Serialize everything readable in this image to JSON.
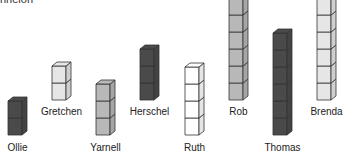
{
  "top_fragment": "nnelon",
  "colors": {
    "dark": "#4a4a4a",
    "medium": "#b8b8b8",
    "light": "#e6e6e6",
    "white": "#ffffff",
    "outline": "#333333"
  },
  "stacks": [
    {
      "name": "Ollie",
      "cubes": 2,
      "shade": "dark",
      "x": 8,
      "bottom": 135,
      "label_y": 142
    },
    {
      "name": "Gretchen",
      "cubes": 2,
      "shade": "light",
      "x": 52,
      "bottom": 100,
      "label_y": 106
    },
    {
      "name": "Yarnell",
      "cubes": 3,
      "shade": "medium",
      "x": 96,
      "bottom": 135,
      "label_y": 142
    },
    {
      "name": "Herschel",
      "cubes": 3,
      "shade": "dark",
      "x": 140,
      "bottom": 100,
      "label_y": 106
    },
    {
      "name": "Ruth",
      "cubes": 4,
      "shade": "white",
      "x": 185,
      "bottom": 135,
      "label_y": 142
    },
    {
      "name": "Rob",
      "cubes": 6,
      "shade": "medium",
      "x": 229,
      "bottom": 100,
      "label_y": 106
    },
    {
      "name": "Thomas",
      "cubes": 6,
      "shade": "dark",
      "x": 273,
      "bottom": 135,
      "label_y": 142
    },
    {
      "name": "Brenda",
      "cubes": 6,
      "shade": "light",
      "x": 317,
      "bottom": 100,
      "label_y": 106
    }
  ]
}
